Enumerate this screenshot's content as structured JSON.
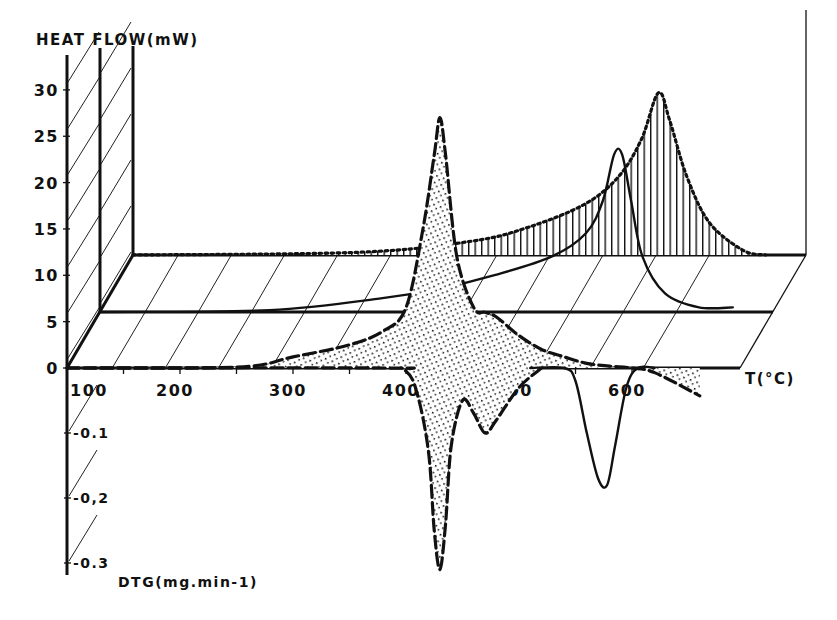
{
  "chart_data": {
    "type": "line",
    "title": "",
    "style": "pseudo-3D stacked thermal analysis plot (TG/DTG/DSC)",
    "xlabel": "T(°C)",
    "ylabel": "HEAT FLOW(mW)",
    "ylabel_secondary": "DTG(mg.min-1)",
    "x_ticks": [
      "100",
      "200",
      "300",
      "400",
      "500",
      "600"
    ],
    "y_ticks": [
      "0",
      "5",
      "10",
      "15",
      "20",
      "25",
      "30"
    ],
    "y_secondary_ticks": [
      "-0.1",
      "-0,2",
      "-0.3"
    ],
    "xlim": [
      100,
      660
    ],
    "ylim": [
      0,
      30
    ],
    "y_secondary_lim": [
      0,
      -0.3
    ],
    "grid": false,
    "planes": [
      "front",
      "middle",
      "back"
    ],
    "series": [
      {
        "name": "Heat flow (front plane, dashed, stippled fill)",
        "plane": "front",
        "line": "dashed",
        "fill": "stipple",
        "x": [
          100,
          250,
          300,
          350,
          380,
          400,
          415,
          425,
          430,
          435,
          445,
          460,
          470,
          480,
          500,
          520,
          540,
          560,
          580,
          600,
          620,
          660
        ],
        "values": [
          0,
          0.1,
          1.2,
          2.5,
          4,
          6.5,
          15,
          23,
          27,
          23,
          12,
          6.5,
          6,
          5.5,
          3.5,
          2,
          1.2,
          0.5,
          0.2,
          0,
          -0.5,
          -3
        ]
      },
      {
        "name": "DTG (front plane, dashed, stippled fill)",
        "plane": "front",
        "line": "dashed",
        "fill": "stipple",
        "x": [
          100,
          380,
          400,
          410,
          420,
          425,
          430,
          435,
          440,
          450,
          460,
          470,
          480,
          500,
          520
        ],
        "values": [
          0,
          0,
          -0.005,
          -0.04,
          -0.13,
          -0.25,
          -0.31,
          -0.24,
          -0.12,
          -0.05,
          -0.07,
          -0.1,
          -0.08,
          -0.03,
          0
        ]
      },
      {
        "name": "DTG second step (front plane, solid)",
        "plane": "front",
        "line": "solid",
        "x": [
          510,
          540,
          550,
          560,
          570,
          578,
          585,
          595,
          605,
          620
        ],
        "values": [
          0,
          0,
          -0.02,
          -0.1,
          -0.17,
          -0.18,
          -0.12,
          -0.03,
          0,
          0
        ]
      },
      {
        "name": "Heat flow (middle plane, solid)",
        "plane": "middle",
        "line": "solid",
        "x": [
          100,
          250,
          350,
          400,
          450,
          500,
          530,
          545,
          555,
          562,
          570,
          580,
          600,
          630,
          660
        ],
        "values": [
          0,
          0.2,
          1.5,
          2.5,
          4,
          6,
          8.5,
          12,
          17,
          17,
          12,
          6,
          2,
          0.5,
          0.5
        ]
      },
      {
        "name": "Heat flow (back plane, dotted, hatched fill)",
        "plane": "back",
        "line": "dotted",
        "fill": "vertical-hatch",
        "x": [
          100,
          300,
          400,
          450,
          500,
          530,
          550,
          565,
          575,
          590,
          610,
          640,
          660
        ],
        "values": [
          0,
          0.3,
          1.5,
          3,
          5.5,
          8.5,
          12.5,
          17.5,
          14.5,
          8.5,
          3.5,
          0.5,
          0
        ]
      }
    ]
  },
  "labels": {
    "heat_flow_axis": "HEAT FLOW(mW)",
    "dtg_axis": "DTG(mg.min-1)",
    "temperature_axis": "T(°C)",
    "y_ticks": [
      "0",
      "5",
      "10",
      "15",
      "20",
      "25",
      "30"
    ],
    "x_ticks": [
      "100",
      "200",
      "300",
      "400",
      "500",
      "600"
    ],
    "dtg_ticks": [
      "-0.1",
      "-0,2",
      "-0.3"
    ]
  }
}
